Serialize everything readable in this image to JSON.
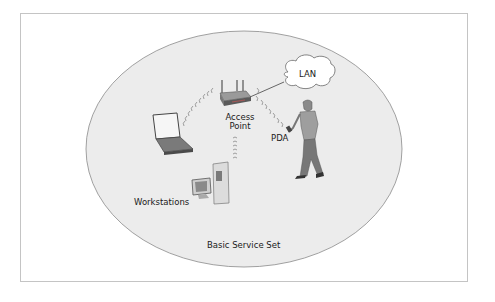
{
  "diagram": {
    "title": "Basic Service Set",
    "nodes": [
      {
        "id": "access-point",
        "label_line1": "Access",
        "label_line2": "Point"
      },
      {
        "id": "lan",
        "label": "LAN"
      },
      {
        "id": "pda",
        "label": "PDA"
      },
      {
        "id": "workstations",
        "label": "Workstations"
      },
      {
        "id": "laptop",
        "label": ""
      }
    ],
    "edges": [
      {
        "from": "access-point",
        "to": "lan",
        "type": "wired"
      },
      {
        "from": "access-point",
        "to": "laptop",
        "type": "wireless"
      },
      {
        "from": "access-point",
        "to": "workstations",
        "type": "wireless"
      },
      {
        "from": "access-point",
        "to": "pda",
        "type": "wireless"
      }
    ],
    "colors": {
      "ellipse_fill": "#ececec",
      "ellipse_stroke": "#8a8a8a",
      "frame_border": "#c4c4c4",
      "cloud_fill": "#ffffff"
    }
  }
}
